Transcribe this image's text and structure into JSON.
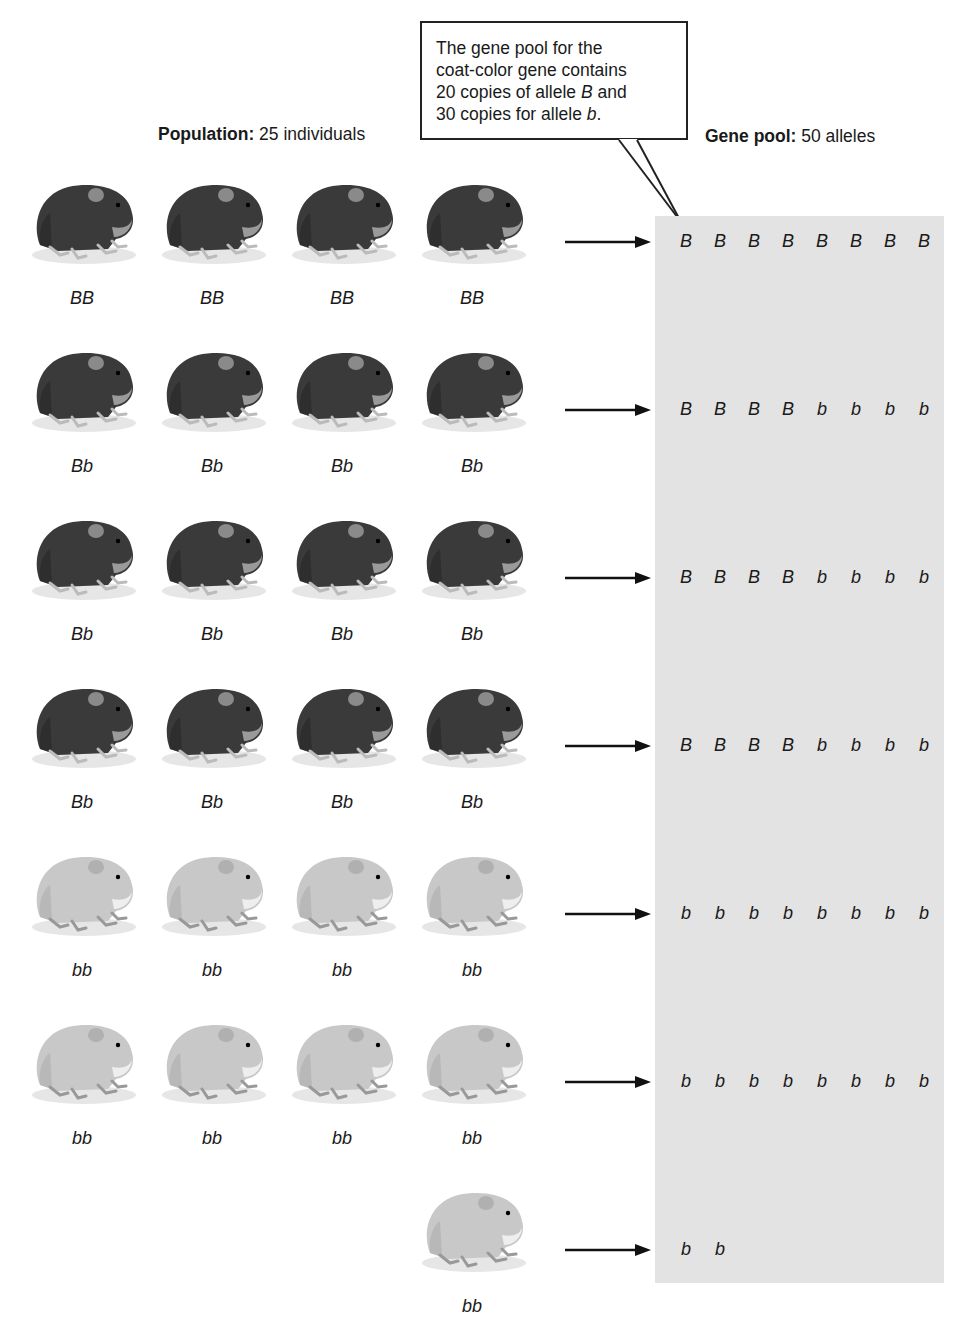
{
  "callout": {
    "lines": [
      "The gene pool for the",
      "coat-color gene contains",
      "20 copies of allele ",
      "30 copies for allele "
    ],
    "line3_italic": "B",
    "line3_tail": " and",
    "line4_italic": "b",
    "line4_tail": "."
  },
  "population_header": {
    "label": "Population:",
    "value": "25 individuals"
  },
  "gene_pool_header": {
    "label": "Gene pool:",
    "value": "50 alleles"
  },
  "colors": {
    "dark_coat": "#3a3a3a",
    "light_coat": "#c8c8c8",
    "pool_bg": "#e3e3e3"
  },
  "rows": [
    {
      "genotypes": [
        "BB",
        "BB",
        "BB",
        "BB"
      ],
      "coat": "dark",
      "alleles": [
        "B",
        "B",
        "B",
        "B",
        "B",
        "B",
        "B",
        "B"
      ]
    },
    {
      "genotypes": [
        "Bb",
        "Bb",
        "Bb",
        "Bb"
      ],
      "coat": "dark",
      "alleles": [
        "B",
        "B",
        "B",
        "B",
        "b",
        "b",
        "b",
        "b"
      ]
    },
    {
      "genotypes": [
        "Bb",
        "Bb",
        "Bb",
        "Bb"
      ],
      "coat": "dark",
      "alleles": [
        "B",
        "B",
        "B",
        "B",
        "b",
        "b",
        "b",
        "b"
      ]
    },
    {
      "genotypes": [
        "Bb",
        "Bb",
        "Bb",
        "Bb"
      ],
      "coat": "dark",
      "alleles": [
        "B",
        "B",
        "B",
        "B",
        "b",
        "b",
        "b",
        "b"
      ]
    },
    {
      "genotypes": [
        "bb",
        "bb",
        "bb",
        "bb"
      ],
      "coat": "light",
      "alleles": [
        "b",
        "b",
        "b",
        "b",
        "b",
        "b",
        "b",
        "b"
      ]
    },
    {
      "genotypes": [
        "bb",
        "bb",
        "bb",
        "bb"
      ],
      "coat": "light",
      "alleles": [
        "b",
        "b",
        "b",
        "b",
        "b",
        "b",
        "b",
        "b"
      ]
    },
    {
      "genotypes": [
        "bb"
      ],
      "coat": "light",
      "start_col": 3,
      "alleles": [
        "b",
        "b"
      ]
    }
  ]
}
